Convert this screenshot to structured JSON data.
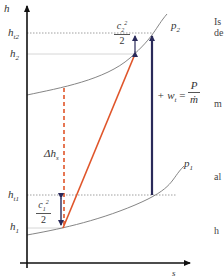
{
  "diagram": {
    "type": "h-s diagram (compressor, isentropic vs real compression)",
    "axes": {
      "y_label": "h",
      "x_label": "s"
    },
    "levels": {
      "h_t2": {
        "main": "h",
        "sub": "t2"
      },
      "h_2": {
        "main": "h",
        "sub": "2"
      },
      "h_t1": {
        "main": "h",
        "sub": "t1"
      },
      "h_1": {
        "main": "h",
        "sub": "1"
      }
    },
    "isobars": {
      "p2": {
        "main": "p",
        "sub": "2"
      },
      "p1": {
        "main": "p",
        "sub": "1"
      }
    },
    "annotations": {
      "kinetic_2": {
        "num": "c",
        "num_sub": "2",
        "num_sup": "2",
        "den": "2"
      },
      "kinetic_1": {
        "num": "c",
        "num_sub": "1",
        "num_sup": "2",
        "den": "2"
      },
      "delta_hs": {
        "main": "Δh",
        "sub": "s"
      },
      "work": {
        "prefix": "+ w",
        "sub": "t",
        "eq": "=",
        "num": "P",
        "den": "ṁ"
      }
    },
    "colors": {
      "axis": "#111111",
      "isobar": "#777777",
      "process_line": "#e0552a",
      "isentropic_dashed": "#e0552a",
      "arrows": "#2a2a5a",
      "guide_dotted": "#888888",
      "guide_solid": "#cccccc"
    }
  },
  "side_text": {
    "line1": "Is",
    "line2": "de",
    "line3": "m",
    "line4": "al",
    "line5": "h"
  }
}
